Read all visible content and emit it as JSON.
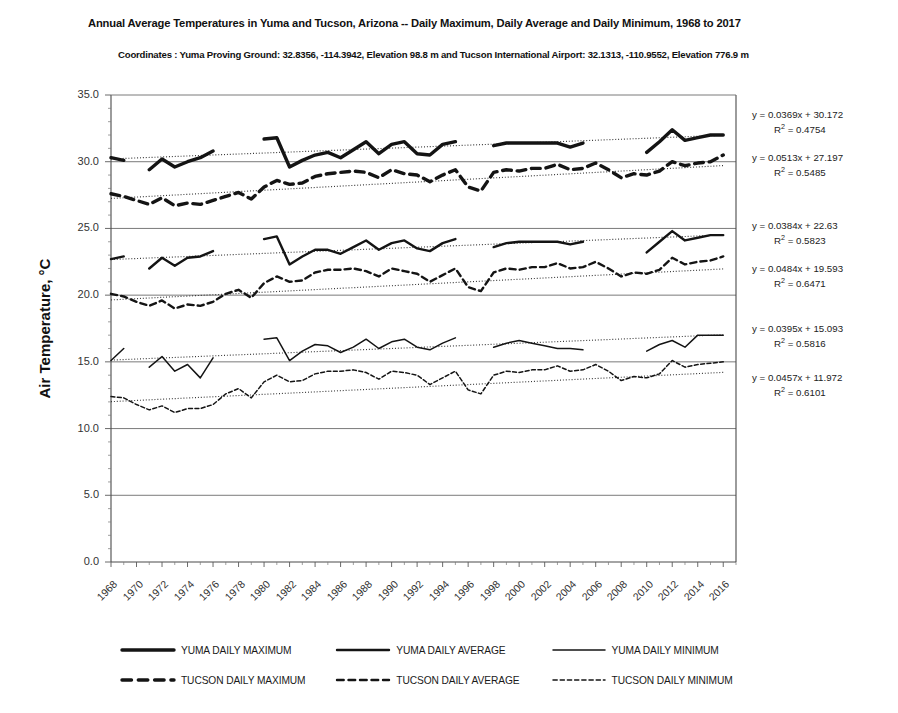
{
  "chart_data": {
    "type": "line",
    "title": "Annual Average Temperatures in Yuma and Tucson, Arizona -- Daily Maximum, Daily Average and Daily Minimum, 1968 to 2017",
    "subtitle": "Coordinates :  Yuma Proving Ground: 32.8356, -114.3942, Elevation 98.8 m and Tucson International Airport: 32.1313, -110.9552, Elevation 776.9 m",
    "xlabel": "",
    "ylabel": "Air Temperature, °C",
    "ylim": [
      0.0,
      35.0
    ],
    "ytick_step": 5.0,
    "yticks": [
      "35.0",
      "30.0",
      "25.0",
      "20.0",
      "15.0",
      "10.0",
      "5.0",
      "0.0"
    ],
    "ytick_values": [
      35.0,
      30.0,
      25.0,
      20.0,
      15.0,
      10.0,
      5.0,
      0.0
    ],
    "y_minor_step": 1.0,
    "grid": true,
    "gridlines_at": [
      30.0,
      25.0,
      20.0,
      15.0,
      10.0,
      5.0
    ],
    "xlim": [
      1968,
      2017
    ],
    "x": [
      1968,
      1969,
      1970,
      1971,
      1972,
      1973,
      1974,
      1975,
      1976,
      1977,
      1978,
      1979,
      1980,
      1981,
      1982,
      1983,
      1984,
      1985,
      1986,
      1987,
      1988,
      1989,
      1990,
      1991,
      1992,
      1993,
      1994,
      1995,
      1996,
      1997,
      1998,
      1999,
      2000,
      2001,
      2002,
      2003,
      2004,
      2005,
      2006,
      2007,
      2008,
      2009,
      2010,
      2011,
      2012,
      2013,
      2014,
      2015,
      2016,
      2017
    ],
    "xticks": [
      "1968",
      "1970",
      "1972",
      "1974",
      "1976",
      "1978",
      "1980",
      "1982",
      "1984",
      "1986",
      "1988",
      "1990",
      "1992",
      "1994",
      "1996",
      "1998",
      "2000",
      "2002",
      "2004",
      "2006",
      "2008",
      "2010",
      "2012",
      "2014",
      "2016"
    ],
    "xtick_values": [
      1968,
      1970,
      1972,
      1974,
      1976,
      1978,
      1980,
      1982,
      1984,
      1986,
      1988,
      1990,
      1992,
      1994,
      1996,
      1998,
      2000,
      2002,
      2004,
      2006,
      2008,
      2010,
      2012,
      2014,
      2016
    ],
    "legend_position": "bottom",
    "series": [
      {
        "name": "YUMA DAILY MAXIMUM",
        "style": "solid",
        "width": 3.4,
        "values": [
          30.3,
          30.1,
          null,
          29.4,
          30.2,
          29.6,
          30.0,
          30.3,
          30.8,
          null,
          null,
          null,
          31.7,
          31.8,
          29.6,
          30.1,
          30.5,
          30.7,
          30.3,
          30.9,
          31.5,
          30.6,
          31.3,
          31.5,
          30.6,
          30.5,
          31.3,
          31.5,
          null,
          null,
          31.2,
          31.4,
          31.4,
          31.4,
          31.4,
          31.4,
          31.1,
          31.4,
          null,
          null,
          null,
          null,
          30.7,
          31.5,
          32.4,
          31.6,
          31.8,
          32.0,
          32.0,
          null
        ]
      },
      {
        "name": "YUMA DAILY AVERAGE",
        "style": "solid",
        "width": 2.4,
        "values": [
          22.7,
          22.9,
          null,
          22.0,
          22.8,
          22.2,
          22.8,
          22.9,
          23.3,
          null,
          null,
          null,
          24.2,
          24.4,
          22.3,
          22.9,
          23.4,
          23.4,
          23.1,
          23.6,
          24.1,
          23.4,
          23.9,
          24.1,
          23.5,
          23.3,
          23.9,
          24.2,
          null,
          null,
          23.6,
          23.9,
          24.0,
          24.0,
          24.0,
          24.0,
          23.8,
          24.0,
          null,
          null,
          null,
          null,
          23.2,
          24.0,
          24.8,
          24.1,
          24.3,
          24.5,
          24.5,
          null
        ]
      },
      {
        "name": "YUMA DAILY MINIMUM",
        "style": "solid",
        "width": 1.5,
        "values": [
          15.1,
          16.0,
          null,
          14.6,
          15.4,
          14.3,
          14.8,
          13.8,
          15.3,
          null,
          null,
          null,
          16.7,
          16.8,
          15.1,
          15.8,
          16.3,
          16.2,
          15.7,
          16.1,
          16.7,
          16.0,
          16.5,
          16.7,
          16.1,
          15.9,
          16.4,
          16.8,
          null,
          null,
          16.1,
          16.4,
          16.6,
          16.4,
          16.2,
          16.0,
          16.0,
          15.9,
          null,
          null,
          null,
          null,
          15.8,
          16.3,
          16.6,
          16.1,
          17.0,
          17.0,
          17.0,
          null
        ]
      },
      {
        "name": "TUCSON DAILY MAXIMUM",
        "style": "dashed",
        "width": 3.4,
        "values": [
          27.6,
          27.4,
          27.1,
          26.8,
          27.3,
          26.7,
          26.9,
          26.8,
          27.1,
          27.4,
          27.7,
          27.2,
          28.1,
          28.6,
          28.3,
          28.4,
          28.9,
          29.1,
          29.2,
          29.3,
          29.2,
          28.8,
          29.4,
          29.1,
          29.0,
          28.5,
          29.0,
          29.4,
          28.1,
          27.8,
          29.2,
          29.4,
          29.3,
          29.5,
          29.5,
          29.8,
          29.4,
          29.5,
          29.9,
          29.4,
          28.8,
          29.1,
          29.0,
          29.3,
          30.0,
          29.7,
          29.9,
          30.0,
          30.5,
          null
        ]
      },
      {
        "name": "TUCSON DAILY AVERAGE",
        "style": "dashed",
        "width": 2.4,
        "values": [
          20.1,
          19.9,
          19.5,
          19.2,
          19.6,
          19.0,
          19.3,
          19.2,
          19.5,
          20.1,
          20.4,
          19.8,
          20.9,
          21.4,
          21.0,
          21.1,
          21.7,
          21.9,
          21.9,
          22.0,
          21.8,
          21.4,
          22.0,
          21.8,
          21.6,
          21.0,
          21.5,
          22.0,
          20.6,
          20.3,
          21.7,
          22.0,
          21.9,
          22.1,
          22.1,
          22.4,
          22.0,
          22.1,
          22.5,
          22.0,
          21.4,
          21.7,
          21.6,
          21.9,
          22.8,
          22.3,
          22.5,
          22.6,
          22.9,
          null
        ]
      },
      {
        "name": "TUCSON DAILY MINIMUM",
        "style": "dashed",
        "width": 1.5,
        "values": [
          12.4,
          12.3,
          11.8,
          11.4,
          11.7,
          11.2,
          11.5,
          11.5,
          11.8,
          12.6,
          13.0,
          12.3,
          13.5,
          14.0,
          13.5,
          13.6,
          14.1,
          14.3,
          14.3,
          14.4,
          14.2,
          13.7,
          14.3,
          14.2,
          14.0,
          13.3,
          13.8,
          14.3,
          12.9,
          12.6,
          14.0,
          14.3,
          14.2,
          14.4,
          14.4,
          14.7,
          14.3,
          14.4,
          14.8,
          14.3,
          13.6,
          13.9,
          13.8,
          14.1,
          15.1,
          14.6,
          14.8,
          14.9,
          15.0,
          null
        ]
      }
    ],
    "trendlines": [
      {
        "series": "YUMA DAILY MAXIMUM",
        "slope": 0.0369,
        "intercept": 30.172,
        "r2": 0.4754,
        "equation": "y = 0.0369x + 30.172",
        "r2_label": "R² = 0.4754"
      },
      {
        "series": "TUCSON DAILY MAXIMUM",
        "slope": 0.0513,
        "intercept": 27.197,
        "r2": 0.5485,
        "equation": "y = 0.0513x + 27.197",
        "r2_label": "R² = 0.5485"
      },
      {
        "series": "YUMA DAILY AVERAGE",
        "slope": 0.0384,
        "intercept": 22.63,
        "r2": 0.5823,
        "equation": "y = 0.0384x + 22.63",
        "r2_label": "R² = 0.5823"
      },
      {
        "series": "TUCSON DAILY AVERAGE",
        "slope": 0.0484,
        "intercept": 19.593,
        "r2": 0.6471,
        "equation": "y = 0.0484x + 19.593",
        "r2_label": "R² = 0.6471"
      },
      {
        "series": "YUMA DAILY MINIMUM",
        "slope": 0.0395,
        "intercept": 15.093,
        "r2": 0.5816,
        "equation": "y = 0.0395x + 15.093",
        "r2_label": "R² = 0.5816"
      },
      {
        "series": "TUCSON DAILY MINIMUM",
        "slope": 0.0457,
        "intercept": 11.972,
        "r2": 0.6101,
        "equation": "y = 0.0457x + 11.972",
        "r2_label": "R² = 0.6101"
      }
    ]
  },
  "equation_blocks": [
    {
      "eq": "y = 0.0369x + 30.172",
      "r2_pre": "R",
      "r2_sup": "2",
      "r2_post": " = 0.4754"
    },
    {
      "eq": "y = 0.0513x + 27.197",
      "r2_pre": "R",
      "r2_sup": "2",
      "r2_post": " = 0.5485"
    },
    {
      "eq": "y = 0.0384x + 22.63",
      "r2_pre": "R",
      "r2_sup": "2",
      "r2_post": " = 0.5823"
    },
    {
      "eq": "y = 0.0484x + 19.593",
      "r2_pre": "R",
      "r2_sup": "2",
      "r2_post": " = 0.6471"
    },
    {
      "eq": "y = 0.0395x + 15.093",
      "r2_pre": "R",
      "r2_sup": "2",
      "r2_post": " = 0.5816"
    },
    {
      "eq": "y = 0.0457x + 11.972",
      "r2_pre": "R",
      "r2_sup": "2",
      "r2_post": " = 0.6101"
    }
  ],
  "legend": {
    "rows": [
      [
        {
          "label": "YUMA DAILY MAXIMUM",
          "style": "solid",
          "width": 3.4,
          "icon": "thick-solid-line-icon"
        },
        {
          "label": "YUMA DAILY AVERAGE",
          "style": "solid",
          "width": 2.4,
          "icon": "medium-solid-line-icon"
        },
        {
          "label": "YUMA DAILY MINIMUM",
          "style": "solid",
          "width": 1.5,
          "icon": "thin-solid-line-icon"
        }
      ],
      [
        {
          "label": "TUCSON DAILY MAXIMUM",
          "style": "dashed",
          "width": 3.4,
          "icon": "thick-dashed-line-icon"
        },
        {
          "label": "TUCSON DAILY AVERAGE",
          "style": "dashed",
          "width": 2.4,
          "icon": "medium-dashed-line-icon"
        },
        {
          "label": "TUCSON DAILY MINIMUM",
          "style": "dashed",
          "width": 1.5,
          "icon": "thin-dashed-line-icon"
        }
      ]
    ]
  },
  "colors": {
    "series": "#141414",
    "grid": "#6b6b6b",
    "axis": "#4a4a4a",
    "text": "#1a1a1a",
    "background": "#ffffff"
  }
}
